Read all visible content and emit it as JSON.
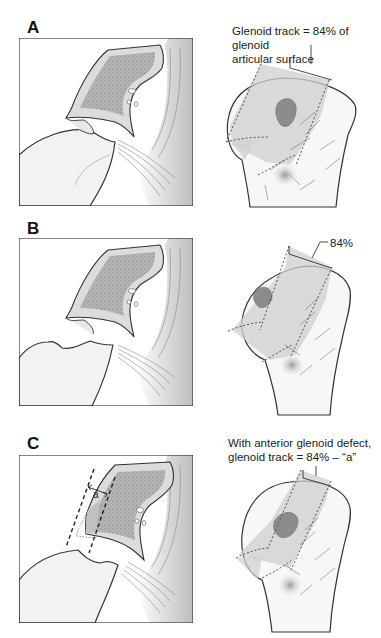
{
  "panels": [
    {
      "label": "A",
      "caption_line1": "Glenoid track = 84% of glenoid",
      "caption_line2": "articular surface"
    },
    {
      "label": "B",
      "caption_line1": "84%"
    },
    {
      "label": "C",
      "caption_line1": "With anterior glenoid defect,",
      "caption_line2": "glenoid track = 84% – “a”",
      "defect_label": "a"
    }
  ],
  "colors": {
    "outline": "#333333",
    "bone_fill": "#f4f4f4",
    "cortex_fill": "#d8d8d8",
    "cancellous_fill": "#a8a8a8",
    "track_fill": "#c8c8c8",
    "lesion_fill": "#8a8a8a"
  }
}
